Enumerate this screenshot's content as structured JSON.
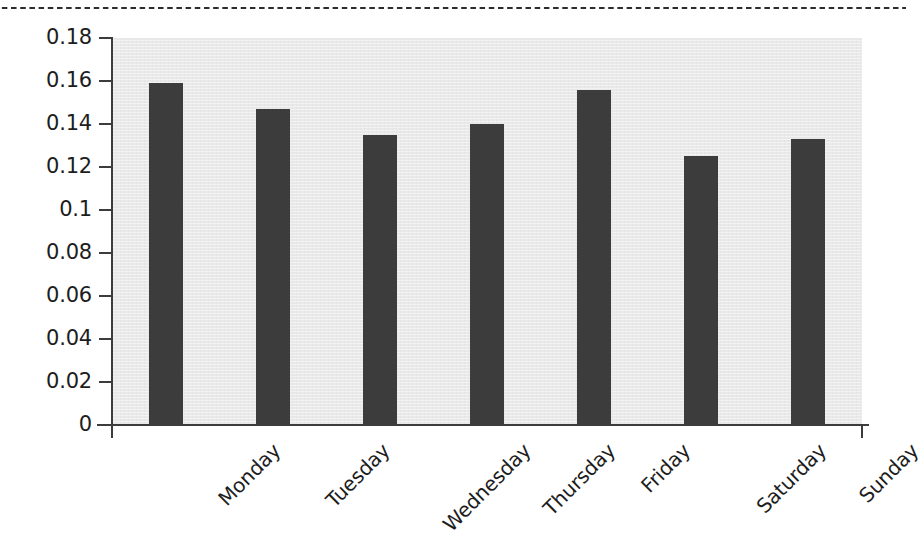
{
  "chart_data": {
    "type": "bar",
    "title": "",
    "subtitle": "",
    "xlabel": "",
    "ylabel": "",
    "categories": [
      "Monday",
      "Tuesday",
      "Wednesday",
      "Thursday",
      "Friday",
      "Saturday",
      "Sunday"
    ],
    "values": [
      0.159,
      0.147,
      0.135,
      0.14,
      0.156,
      0.125,
      0.133
    ],
    "series": [
      {
        "name": "",
        "values": [
          0.159,
          0.147,
          0.135,
          0.14,
          0.156,
          0.125,
          0.133
        ]
      }
    ],
    "ylim": [
      0,
      0.18
    ],
    "yticks": [
      0,
      0.02,
      0.04,
      0.06,
      0.08,
      0.1,
      0.12,
      0.14,
      0.16,
      0.18
    ],
    "ytick_labels": [
      "0",
      "0.02",
      "0.04",
      "0.06",
      "0.08",
      "0.1",
      "0.12",
      "0.14",
      "0.16",
      "0.18"
    ],
    "grid": false,
    "legend": false,
    "legend_position": "none",
    "bar_color": "#3c3c3c",
    "plot_background_color": "#e9e9e9",
    "axis_color": "#3c3c3c",
    "figure_background_color": "#ffffff",
    "xtick_label_rotation": -45
  },
  "decorations": {
    "top_rule_style": "dotted",
    "top_rule_color": "#2c2c2c"
  }
}
